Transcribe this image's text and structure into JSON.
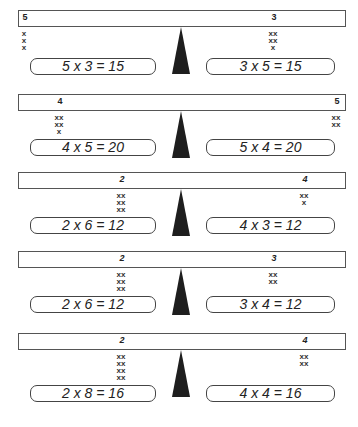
{
  "colors": {
    "ink": "#1e1e1e",
    "background": "#ffffff",
    "outline": "#444444"
  },
  "panels": [
    {
      "top": 10,
      "left": {
        "label": "5",
        "label_x": 24,
        "italic": false,
        "marks": [
          "x",
          "x",
          "x"
        ],
        "equation": "5 x 3 = 15"
      },
      "right": {
        "label": "3",
        "label_x": 273,
        "italic": false,
        "marks": [
          "xx",
          "xx",
          "x"
        ],
        "equation": "3 x 5 = 15"
      }
    },
    {
      "top": 94,
      "left": {
        "label": "4",
        "label_x": 59,
        "italic": false,
        "marks": [
          "xx",
          "xx",
          "x"
        ],
        "equation": "4 x 5 = 20"
      },
      "right": {
        "label": "5",
        "label_x": 336,
        "italic": false,
        "marks": [
          "xx",
          "xx"
        ],
        "equation": "5 x 4 = 20"
      }
    },
    {
      "top": 172,
      "left": {
        "label": "2",
        "label_x": 121,
        "italic": true,
        "marks": [
          "xx",
          "xx",
          "xx"
        ],
        "equation": "2 x 6 = 12"
      },
      "right": {
        "label": "4",
        "label_x": 304,
        "italic": true,
        "marks": [
          "xx",
          "x"
        ],
        "equation": "4 x 3 = 12"
      }
    },
    {
      "top": 251,
      "left": {
        "label": "2",
        "label_x": 121,
        "italic": true,
        "marks": [
          "xx",
          "xx",
          "xx"
        ],
        "equation": "2 x 6 = 12"
      },
      "right": {
        "label": "3",
        "label_x": 273,
        "italic": true,
        "marks": [
          "xx",
          "xx"
        ],
        "equation": "3 x 4 = 12"
      }
    },
    {
      "top": 333,
      "left": {
        "label": "2",
        "label_x": 121,
        "italic": true,
        "marks": [
          "xx",
          "xx",
          "xx",
          "xx"
        ],
        "equation": "2 x 8 = 16"
      },
      "right": {
        "label": "4",
        "label_x": 304,
        "italic": true,
        "marks": [
          "xx",
          "xx"
        ],
        "equation": "4 x 4 = 16"
      }
    }
  ]
}
